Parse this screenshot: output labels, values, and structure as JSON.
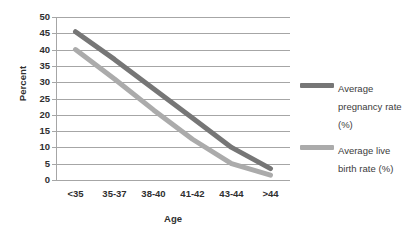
{
  "chart_data": {
    "type": "line",
    "title": "",
    "xlabel": "Age",
    "ylabel": "Percent",
    "categories": [
      "<35",
      "35-37",
      "38-40",
      "41-42",
      "43-44",
      ">44"
    ],
    "ylim": [
      0,
      50
    ],
    "ytick_step": 5,
    "yticks": [
      50,
      45,
      40,
      35,
      30,
      25,
      20,
      15,
      10,
      5,
      0
    ],
    "grid": true,
    "legend_position": "right",
    "series": [
      {
        "name": "Average pregnancy rate (%)",
        "color": "#767676",
        "values": [
          45.5,
          37,
          28,
          19,
          10,
          3.5
        ]
      },
      {
        "name": "Average live birth rate (%)",
        "color": "#ababab",
        "values": [
          40,
          31,
          21.5,
          12.5,
          5,
          1.5
        ]
      }
    ]
  },
  "axes": {
    "y_title": "Percent",
    "x_title": "Age"
  },
  "legend": {
    "items": [
      {
        "label": "Average pregnancy rate (%)"
      },
      {
        "label": "Average live birth rate (%)"
      }
    ]
  },
  "colors": {
    "series_dark": "#767676",
    "series_light": "#ababab",
    "gridline": "#a6a6a6",
    "text": "#2f2f2f",
    "background": "#ffffff"
  }
}
